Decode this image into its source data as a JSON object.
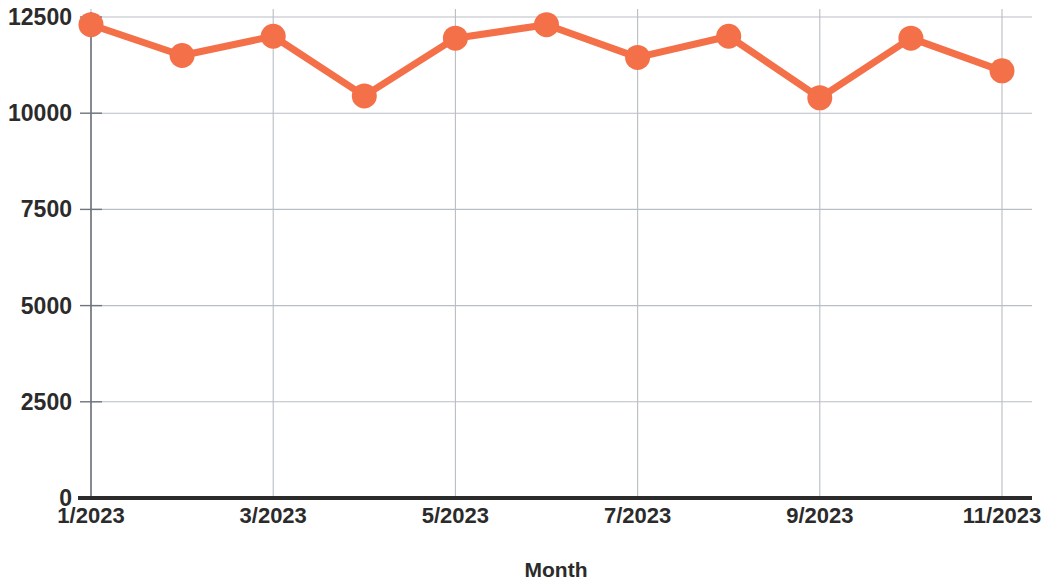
{
  "chart_data": {
    "type": "line",
    "title": "",
    "xlabel": "Month",
    "ylabel": "",
    "x": [
      "1/2023",
      "2/2023",
      "3/2023",
      "4/2023",
      "5/2023",
      "6/2023",
      "7/2023",
      "8/2023",
      "9/2023",
      "10/2023",
      "11/2023"
    ],
    "categories": [
      "1/2023",
      "2/2023",
      "3/2023",
      "4/2023",
      "5/2023",
      "6/2023",
      "7/2023",
      "8/2023",
      "9/2023",
      "10/2023",
      "11/2023"
    ],
    "values": [
      12300,
      11500,
      12000,
      10450,
      11950,
      12300,
      11450,
      12000,
      10400,
      11950,
      11100
    ],
    "series": [
      {
        "name": "Monthly value",
        "values": [
          12300,
          11500,
          12000,
          10450,
          11950,
          12300,
          11450,
          12000,
          10400,
          11950,
          11100
        ],
        "color": "#F47049",
        "marker": "circle"
      }
    ],
    "xtick_labels": [
      "1/2023",
      "3/2023",
      "5/2023",
      "7/2023",
      "9/2023",
      "11/2023"
    ],
    "xtick_values": [
      1,
      3,
      5,
      7,
      9,
      11
    ],
    "ytick_labels": [
      "0",
      "2500",
      "5000",
      "7500",
      "10000",
      "12500"
    ],
    "ytick_values": [
      0,
      2500,
      5000,
      7500,
      10000,
      12500
    ],
    "ylim": [
      0,
      12500
    ],
    "xlim": [
      1,
      11
    ],
    "grid": true,
    "grid_axes": "both",
    "legend": "none",
    "line_color": "#F47049",
    "marker_color": "#F47049",
    "axis_color": "#2b2b2b",
    "grid_color": "#b9bec4",
    "background": "#ffffff"
  },
  "axis": {
    "x_title": "Month"
  }
}
